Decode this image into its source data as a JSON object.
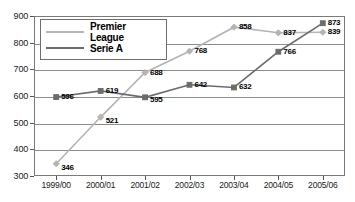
{
  "chart_data": {
    "type": "line",
    "title": "",
    "xlabel": "",
    "ylabel": "",
    "categories": [
      "1999/00",
      "2000/01",
      "2001/02",
      "2002/03",
      "2003/04",
      "2004/05",
      "2005/06"
    ],
    "ylim": [
      300,
      900
    ],
    "yticks": [
      300,
      400,
      500,
      600,
      700,
      800,
      900
    ],
    "grid": true,
    "legend_position": "top-left",
    "series": [
      {
        "name": "Premier League",
        "color": "#b4b4b4",
        "marker": "diamond",
        "values": [
          346,
          521,
          688,
          768,
          858,
          837,
          839
        ]
      },
      {
        "name": "Serie A",
        "color": "#6b6b6b",
        "marker": "square",
        "values": [
          596,
          619,
          595,
          642,
          632,
          766,
          873
        ]
      }
    ]
  },
  "colors": {
    "premier_league": "#b4b4b4",
    "serie_a": "#6b6b6b",
    "axis": "#7a7a7a",
    "grid": "#8c8c8c",
    "text": "#1a1a1a"
  }
}
